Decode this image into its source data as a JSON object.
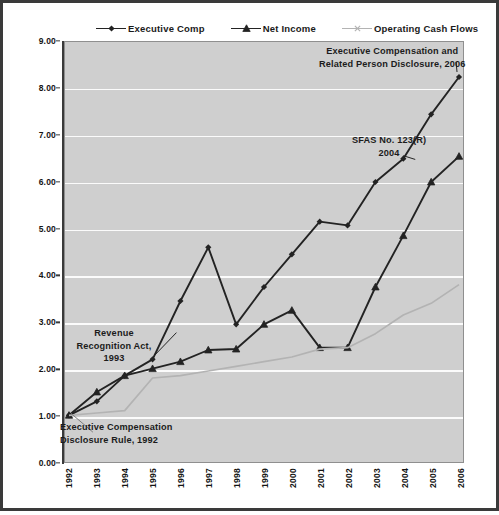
{
  "chart_data": {
    "type": "line",
    "title": "",
    "xlabel": "",
    "ylabel": "",
    "categories": [
      "1992",
      "1993",
      "1994",
      "1995",
      "1996",
      "1997",
      "1998",
      "1999",
      "2000",
      "2001",
      "2002",
      "2003",
      "2004",
      "2005",
      "2006"
    ],
    "ylim": [
      0,
      9
    ],
    "y_tick_labels": [
      "0.00",
      "1.00",
      "2.00",
      "3.00",
      "4.00",
      "5.00",
      "6.00",
      "7.00",
      "8.00",
      "9.00"
    ],
    "y_tick_values": [
      0,
      1,
      2,
      3,
      4,
      5,
      6,
      7,
      8,
      9
    ],
    "grid": true,
    "legend_position": "top",
    "series": [
      {
        "name": "Executive Comp",
        "marker": "diamond",
        "color": "#232323",
        "values": [
          1.0,
          1.3,
          1.85,
          2.2,
          3.45,
          4.6,
          2.95,
          3.75,
          4.45,
          5.15,
          5.07,
          6.0,
          6.5,
          7.45,
          8.25
        ]
      },
      {
        "name": "Net Income",
        "marker": "triangle",
        "color": "#232323",
        "values": [
          1.0,
          1.5,
          1.85,
          2.0,
          2.15,
          2.4,
          2.42,
          2.95,
          3.25,
          2.45,
          2.45,
          3.75,
          4.85,
          6.0,
          6.55
        ]
      },
      {
        "name": "Operating Cash Flows",
        "marker": "x",
        "color": "#b3b3b3",
        "values": [
          1.0,
          1.05,
          1.1,
          1.8,
          1.85,
          1.95,
          2.05,
          2.15,
          2.25,
          2.42,
          2.45,
          2.75,
          3.15,
          3.4,
          3.8
        ]
      }
    ],
    "annotations": [
      {
        "id": "exec-comp-2006",
        "lines": [
          "Executive Compensation  and",
          "Related Person Disclosure,  2006"
        ]
      },
      {
        "id": "sfas-123r",
        "lines": [
          "SFAS No. 123(R)",
          "2004"
        ]
      },
      {
        "id": "revenue-recognition-act",
        "lines": [
          "Revenue",
          "Recognition Act,",
          "1993"
        ]
      },
      {
        "id": "exec-comp-disclosure-rule",
        "lines": [
          "Executive Compensation",
          "Disclosure Rule, 1992"
        ]
      }
    ]
  },
  "legend": {
    "items": [
      {
        "label": "Executive  Comp"
      },
      {
        "label": "Net Income"
      },
      {
        "label": "Operating  Cash Flows"
      }
    ]
  },
  "annotations": {
    "exec_comp_2006_line1": "Executive Compensation  and",
    "exec_comp_2006_line2": "Related Person Disclosure,  2006",
    "sfas_line1": "SFAS No. 123(R)",
    "sfas_line2": "2004",
    "revenue_line1": "Revenue",
    "revenue_line2": "Recognition Act,",
    "revenue_line3": "1993",
    "exec_disclosure_line1": "Executive Compensation",
    "exec_disclosure_line2": "Disclosure Rule, 1992"
  }
}
